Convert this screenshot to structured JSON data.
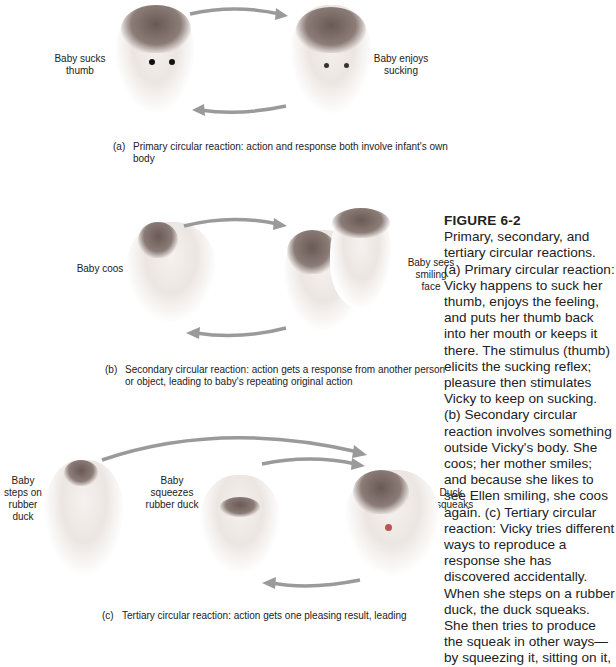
{
  "figure": {
    "title": "FIGURE 6-2",
    "description": "Primary, secondary, and tertiary circular reactions. (a) Primary circular reaction: Vicky happens to suck her thumb, enjoys the feeling, and puts her thumb back into her mouth or keeps it there. The stimulus (thumb) elicits the sucking reflex; pleasure then stimulates Vicky to keep on sucking. (b) Secondary circular reaction involves something outside Vicky's body. She coos; her mother smiles; and because she likes to see Ellen smiling, she coos again. (c) Tertiary circular reaction: Vicky tries different ways to reproduce a response she has discovered accidentally. When she steps on a rubber duck, the duck squeaks. She then tries to produce the squeak in other ways—by squeezing it, sitting on it,"
  },
  "panels": {
    "a": {
      "label_left": "Baby sucks thumb",
      "label_right": "Baby enjoys sucking",
      "caption_tag": "(a)",
      "caption": "Primary circular reaction:  action and response both involve infant's own body"
    },
    "b": {
      "label_left": "Baby coos",
      "label_right": "Baby sees smiling face",
      "caption_tag": "(b)",
      "caption": "Secondary circular reaction:  action gets a response from another person or object, leading to baby's repeating original action"
    },
    "c": {
      "label_left": "Baby steps on rubber duck",
      "label_middle": "Baby squeezes rubber duck",
      "label_right": "Duck squeaks",
      "caption_tag": "(c)",
      "caption": "Tertiary circular reaction:  action gets one pleasing result, leading"
    }
  },
  "colors": {
    "arrow": "#9a9a9a",
    "text": "#222222"
  }
}
